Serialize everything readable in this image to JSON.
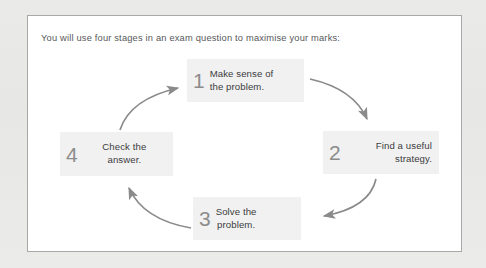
{
  "page": {
    "background_color": "#e9e9e7",
    "card_background": "#ffffff",
    "card_border_color": "#a8a8a8"
  },
  "intro": {
    "text": "You will use four stages in an exam question to maximise your marks:"
  },
  "diagram": {
    "type": "cycle",
    "box_fill": "#f1f1f1",
    "numeral_color": "#8c8c8c",
    "text_color": "#3c3c3e",
    "arrow_color": "#8a8a8a",
    "stages": [
      {
        "number": "1",
        "line1": "Make sense of",
        "line2": "the problem.",
        "position": "top"
      },
      {
        "number": "2",
        "line1": "Find a useful",
        "line2": "strategy.",
        "position": "right"
      },
      {
        "number": "3",
        "line1": "Solve the",
        "line2": "problem.",
        "position": "bottom"
      },
      {
        "number": "4",
        "line1": "Check the",
        "line2": "answer.",
        "position": "left"
      }
    ],
    "arrows": [
      {
        "from": "1",
        "to": "2"
      },
      {
        "from": "2",
        "to": "3"
      },
      {
        "from": "3",
        "to": "4"
      },
      {
        "from": "4",
        "to": "1"
      }
    ]
  }
}
